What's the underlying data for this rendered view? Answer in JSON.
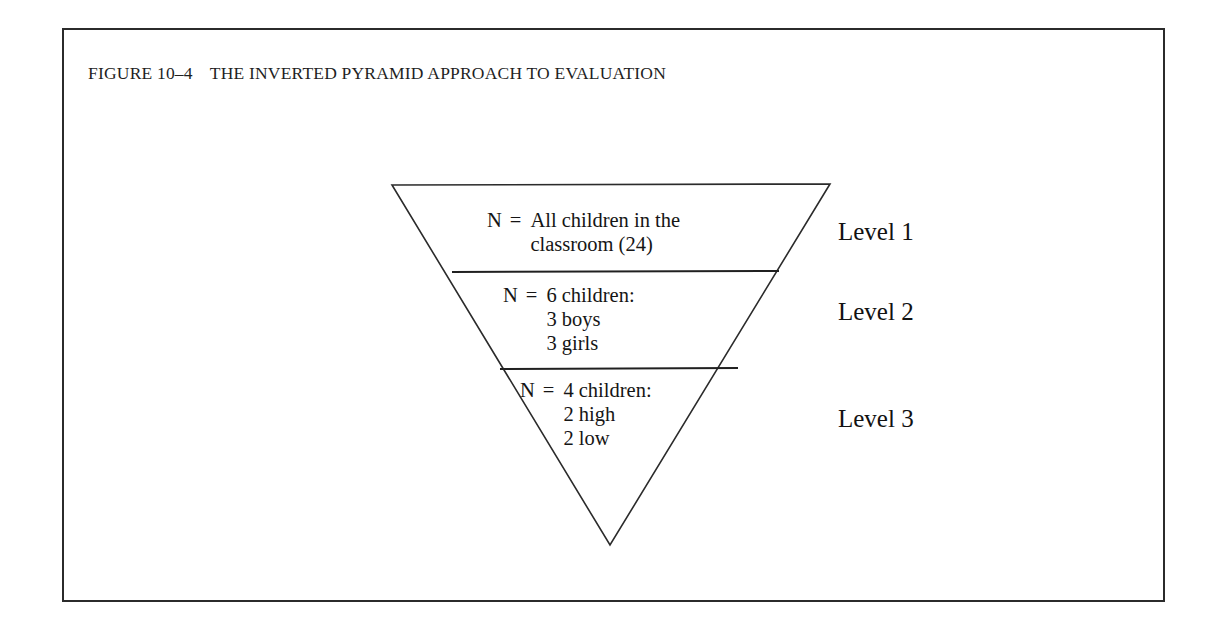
{
  "figure": {
    "caption_number": "FIGURE 10–4",
    "caption_title": "THE INVERTED PYRAMID APPROACH TO EVALUATION"
  },
  "pyramid": {
    "bands": [
      {
        "id": "band-1",
        "lead": "N",
        "equals": "=",
        "lines": [
          "All children in the",
          "classroom (24)"
        ],
        "level_label": "Level 1"
      },
      {
        "id": "band-2",
        "lead": "N",
        "equals": "=",
        "lines": [
          "6 children:",
          "3 boys",
          "3 girls"
        ],
        "level_label": "Level 2"
      },
      {
        "id": "band-3",
        "lead": "N",
        "equals": "=",
        "lines": [
          "4 children:",
          "2 high",
          "2 low"
        ],
        "level_label": "Level 3"
      }
    ]
  },
  "colors": {
    "ink": "#1a1a1a",
    "rule": "#2b2b2b",
    "page": "#ffffff"
  }
}
